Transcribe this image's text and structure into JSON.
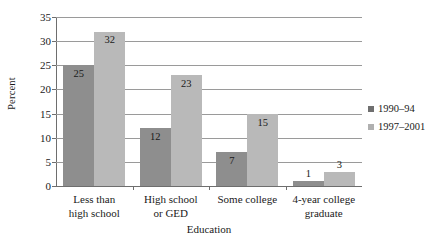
{
  "chart_data": {
    "type": "bar",
    "title": "",
    "xlabel": "Education",
    "ylabel": "Percent",
    "ylim": [
      0,
      35
    ],
    "ytick_step": 5,
    "yticks": [
      "0",
      "5",
      "10",
      "15",
      "20",
      "25",
      "30",
      "35"
    ],
    "grid": true,
    "legend_position": "right",
    "categories": [
      "Less than\nhigh school",
      "High school\nor GED",
      "Some college",
      "4-year college\ngraduate"
    ],
    "category_lines": [
      [
        "Less than",
        "high school"
      ],
      [
        "High school",
        "or GED"
      ],
      [
        "Some college",
        ""
      ],
      [
        "4-year college",
        "graduate"
      ]
    ],
    "series": [
      {
        "name": "1990–94",
        "color": "#8e8e8e",
        "legend_color": "#6f6f6f",
        "values": [
          25,
          12,
          7,
          1
        ],
        "labels": [
          "25",
          "12",
          "7",
          "1"
        ]
      },
      {
        "name": "1997–2001",
        "color": "#b9b9b9",
        "legend_color": "#b0b0b0",
        "values": [
          32,
          23,
          15,
          3
        ],
        "labels": [
          "32",
          "23",
          "15",
          "3"
        ]
      }
    ]
  },
  "legend": {
    "items": [
      {
        "label": "1990–94"
      },
      {
        "label": "1997–2001"
      }
    ]
  }
}
